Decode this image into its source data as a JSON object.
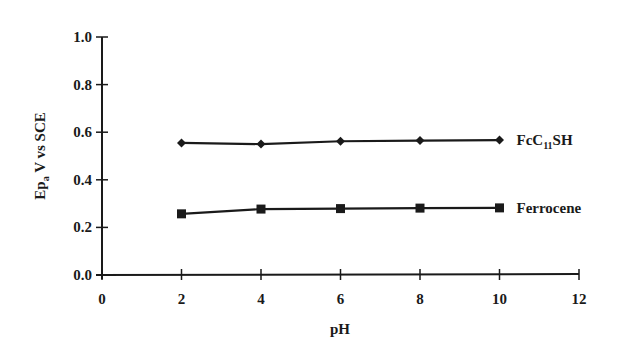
{
  "chart_data": {
    "type": "line",
    "title": "",
    "xlabel": "pH",
    "ylabel": "Ep_a V vs SCE",
    "ylabel_parts": {
      "main": "Ep",
      "sub": "a",
      "rest": " V vs SCE"
    },
    "xlim": [
      0,
      12
    ],
    "ylim": [
      0.0,
      1.0
    ],
    "x_ticks": [
      "0",
      "2",
      "4",
      "6",
      "8",
      "10",
      "12"
    ],
    "y_ticks": [
      "0.0",
      "0.2",
      "0.4",
      "0.6",
      "0.8",
      "1.0"
    ],
    "grid": false,
    "legend_position": "inline-right",
    "x": [
      2,
      4,
      6,
      8,
      10
    ],
    "series": [
      {
        "name": "FcC11SH",
        "label_parts": {
          "main": "FcC",
          "sub": "11",
          "rest": "SH"
        },
        "marker": "diamond",
        "values": [
          0.555,
          0.55,
          0.562,
          0.565,
          0.567
        ]
      },
      {
        "name": "Ferrocene",
        "label_parts": {
          "main": "Ferrocene",
          "sub": "",
          "rest": ""
        },
        "marker": "square",
        "values": [
          0.257,
          0.277,
          0.279,
          0.281,
          0.282
        ]
      }
    ],
    "colors": {
      "line": "#1a1a1a",
      "background": "#ffffff"
    }
  }
}
